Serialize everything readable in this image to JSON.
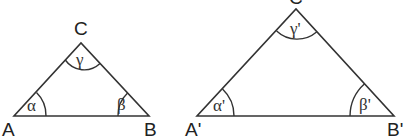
{
  "diagram": {
    "colors": {
      "stroke": "#333333",
      "text": "#222222",
      "background": "#ffffff"
    },
    "triangles": [
      {
        "name": "ABC",
        "vertices": {
          "A": {
            "label": "A",
            "x": 14,
            "y": 116
          },
          "B": {
            "label": "B",
            "x": 149,
            "y": 116
          },
          "C": {
            "label": "C",
            "x": 81,
            "y": 43
          }
        },
        "angles": {
          "A": "α",
          "B": "β",
          "C": "γ"
        }
      },
      {
        "name": "A'B'C'",
        "vertices": {
          "A": {
            "label": "A'",
            "x": 197,
            "y": 116
          },
          "B": {
            "label": "B'",
            "x": 394,
            "y": 116
          },
          "C": {
            "label": "C'",
            "x": 296,
            "y": 9
          }
        },
        "angles": {
          "A": "α'",
          "B": "β'",
          "C": "γ'"
        }
      }
    ]
  }
}
